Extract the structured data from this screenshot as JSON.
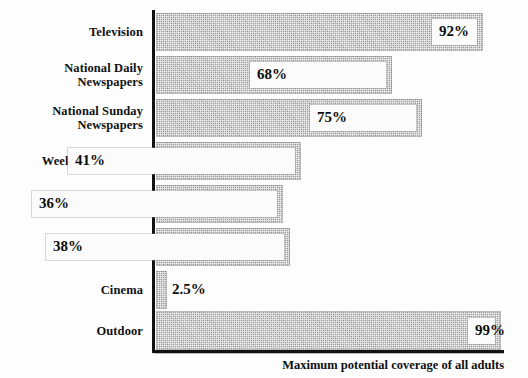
{
  "chart_data": {
    "type": "bar",
    "orientation": "horizontal",
    "title": "",
    "subtitle": "",
    "xlabel": "Maximum potential coverage of all adults",
    "ylabel": "",
    "categories": [
      "Television",
      "National Daily Newspapers",
      "National Sunday Newspapers",
      "Weekly Magazines",
      "Monthly Magazines",
      "Radio",
      "Cinema",
      "Outdoor"
    ],
    "values": [
      92,
      68,
      75,
      41,
      36,
      38,
      2.5,
      99
    ],
    "value_labels": [
      "92%",
      "68%",
      "75%",
      "41%",
      "36%",
      "38%",
      "2.5%",
      "99%"
    ],
    "units": "percent",
    "xlim": [
      0,
      100
    ],
    "grid": false,
    "legend": false,
    "bar_color": "#a8a8a8",
    "axis_color": "#121212",
    "text_color": "#111111"
  },
  "chart": {
    "caption": "Maximum potential coverage of all adults",
    "rows": [
      {
        "label_lines": [
          "Television"
        ],
        "value_label": "92%",
        "value": 92,
        "label_placement": "inside",
        "top": 13,
        "height": 38,
        "bar_width": 327
      },
      {
        "label_lines": [
          "National Daily",
          "Newspapers"
        ],
        "value_label": "68%",
        "value": 68,
        "label_placement": "inside",
        "top": 56,
        "height": 38,
        "bar_width": 236
      },
      {
        "label_lines": [
          "National Sunday",
          "Newspapers"
        ],
        "value_label": "75%",
        "value": 75,
        "label_placement": "inside",
        "top": 99,
        "height": 38,
        "bar_width": 266
      },
      {
        "label_lines": [
          "Weekly Magazines"
        ],
        "value_label": "41%",
        "value": 41,
        "label_placement": "inside",
        "top": 142,
        "height": 38,
        "bar_width": 145
      },
      {
        "label_lines": [
          "Monthly Magazines"
        ],
        "value_label": "36%",
        "value": 36,
        "label_placement": "inside",
        "top": 185,
        "height": 38,
        "bar_width": 127
      },
      {
        "label_lines": [
          "Radio"
        ],
        "value_label": "38%",
        "value": 38,
        "label_placement": "inside",
        "top": 228,
        "height": 38,
        "bar_width": 134
      },
      {
        "label_lines": [
          "Cinema"
        ],
        "value_label": "2.5%",
        "value": 2.5,
        "label_placement": "outside",
        "top": 271,
        "height": 38,
        "bar_width": 11
      },
      {
        "label_lines": [
          "Outdoor"
        ],
        "value_label": "99%",
        "value": 99,
        "label_placement": "inside",
        "top": 311,
        "height": 39,
        "bar_width": 345
      }
    ]
  }
}
